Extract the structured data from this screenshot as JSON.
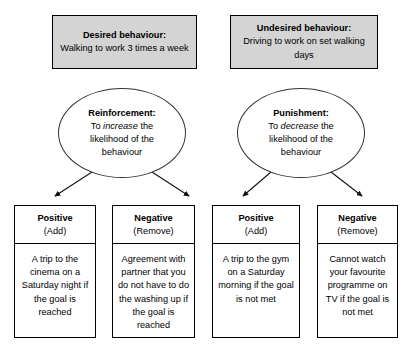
{
  "diagram": {
    "colors": {
      "box_fill": "#d4d4d4",
      "border": "#000000",
      "ellipse_border": "#333333",
      "background": "#ffffff",
      "text": "#000000"
    },
    "branches": [
      {
        "behaviour": {
          "title": "Desired behaviour:",
          "description": "Walking to work 3 times a week"
        },
        "concept": {
          "title": "Reinforcement:",
          "line_prefix": "To ",
          "emphasis": "increase",
          "line_suffix": " the",
          "line_2": "likelihood of the",
          "line_3": "behaviour"
        },
        "outcomes": [
          {
            "label": "Positive",
            "sublabel": "(Add)",
            "example": "A trip to the cinema on a Saturday night if the goal is reached"
          },
          {
            "label": "Negative",
            "sublabel": "(Remove)",
            "example": "Agreement with partner that you do not have to do the washing up if the goal is reached"
          }
        ]
      },
      {
        "behaviour": {
          "title": "Undesired behaviour:",
          "description": "Driving to work on set walking days"
        },
        "concept": {
          "title": "Punishment:",
          "line_prefix": "To ",
          "emphasis": "decrease",
          "line_suffix": " the",
          "line_2": "likelihood of the",
          "line_3": "behaviour"
        },
        "outcomes": [
          {
            "label": "Positive",
            "sublabel": "(Add)",
            "example": "A trip to the gym on a Saturday morning if the goal is not met"
          },
          {
            "label": "Negative",
            "sublabel": "(Remove)",
            "example": "Cannot watch your favourite programme on TV if the goal is not met"
          }
        ]
      }
    ]
  }
}
